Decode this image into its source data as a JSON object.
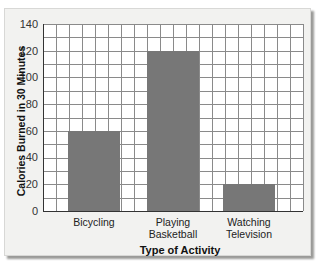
{
  "chart_data": {
    "type": "bar",
    "title": "",
    "categories": [
      "Bicycling",
      "Playing Basketball",
      "Watching Television"
    ],
    "category_lines": [
      [
        "Bicycling"
      ],
      [
        "Playing",
        "Basketball"
      ],
      [
        "Watching",
        "Television"
      ]
    ],
    "values": [
      60,
      120,
      20
    ],
    "xlabel": "Type of Activity",
    "ylabel": "Calories Burned in 30 Minutes",
    "ylim": [
      0,
      140
    ],
    "yticks": [
      "0",
      "20",
      "40",
      "60",
      "80",
      "100",
      "120",
      "140"
    ],
    "grid": true,
    "bar_color": "#777777",
    "legend": null
  }
}
